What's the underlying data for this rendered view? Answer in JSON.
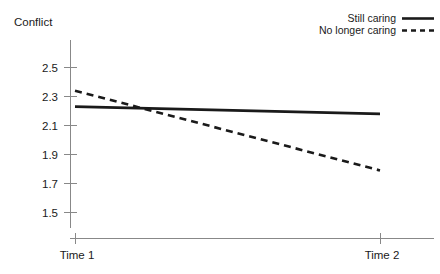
{
  "chart_data": {
    "type": "line",
    "title": "",
    "ylabel": "Conflict",
    "xlabel": "",
    "categories": [
      "Time 1",
      "Time 2"
    ],
    "x_tick_labels": [
      "Time 1",
      "Time 2"
    ],
    "y_tick_labels": [
      "1.5",
      "1.7",
      "1.9",
      "2.1",
      "2.3",
      "2.5"
    ],
    "y_tick_values": [
      1.5,
      1.7,
      1.9,
      2.1,
      2.3,
      2.5
    ],
    "ylim": [
      1.44,
      2.58
    ],
    "grid": false,
    "legend_position": "top-right",
    "series": [
      {
        "name": "Still caring",
        "style": "solid",
        "color": "#1a1a1a",
        "values": [
          2.23,
          2.18
        ]
      },
      {
        "name": "No longer caring",
        "style": "dashed",
        "color": "#1a1a1a",
        "values": [
          2.34,
          1.79
        ]
      }
    ],
    "legend": [
      {
        "label": "Still caring",
        "style": "solid"
      },
      {
        "label": "No longer caring",
        "style": "dashed"
      }
    ]
  }
}
